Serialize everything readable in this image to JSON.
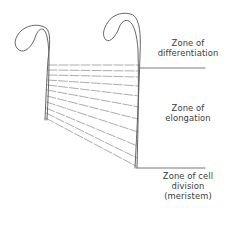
{
  "diagram": {
    "colors": {
      "stroke": "#555555",
      "text": "#3a3a3a",
      "background": "#ffffff"
    },
    "zones": [
      {
        "id": "differentiation",
        "lines": [
          "Zone of",
          "differentiation"
        ]
      },
      {
        "id": "elongation",
        "lines": [
          "Zone of",
          "elongation"
        ]
      },
      {
        "id": "cell_division",
        "lines": [
          "Zone of cell",
          "division",
          "(meristem)"
        ]
      }
    ]
  }
}
